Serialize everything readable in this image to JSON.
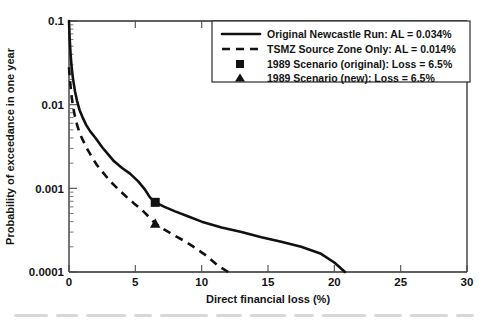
{
  "chart_data": {
    "type": "line",
    "title": "",
    "xlabel": "Direct financial loss (%)",
    "ylabel": "Probability of exceedance in one year",
    "xlim": [
      0,
      30
    ],
    "ylim": [
      0.0001,
      0.1
    ],
    "yscale": "log",
    "xscale": "linear",
    "grid": false,
    "legend_position": "upper right",
    "xticks": [
      0,
      5,
      10,
      15,
      20,
      25,
      30
    ],
    "xtick_labels": [
      "0",
      "5",
      "10",
      "15",
      "20",
      "25",
      "30"
    ],
    "yticks": [
      0.1,
      0.01,
      0.001,
      0.0001
    ],
    "ytick_labels": [
      "0.1",
      "0.01",
      "0.001",
      "0.0001"
    ],
    "series": [
      {
        "name": "Original Newcastle Run: AL = 0.034%",
        "style": "solid",
        "color": "#111111",
        "x": [
          0.0,
          0.05,
          0.12,
          0.2,
          0.3,
          0.45,
          0.6,
          0.8,
          1.0,
          1.3,
          1.6,
          2.0,
          2.5,
          3.0,
          3.4,
          4.0,
          4.6,
          5.2,
          5.7,
          6.1,
          6.5,
          7.2,
          8.0,
          9.0,
          10.0,
          11.5,
          13.0,
          14.5,
          16.0,
          17.5,
          19.0,
          20.0,
          20.8
        ],
        "y": [
          0.1,
          0.062,
          0.04,
          0.028,
          0.0205,
          0.0145,
          0.0112,
          0.0086,
          0.0072,
          0.0057,
          0.0048,
          0.004,
          0.0031,
          0.0025,
          0.0021,
          0.00175,
          0.0015,
          0.00122,
          0.00098,
          0.00078,
          0.00068,
          0.0006,
          0.00053,
          0.00046,
          0.0004,
          0.00034,
          0.0003,
          0.00026,
          0.00023,
          0.0002,
          0.000165,
          0.00013,
          0.0001
        ]
      },
      {
        "name": "TSMZ Source Zone Only: AL = 0.014%",
        "style": "dashed",
        "color": "#111111",
        "x": [
          0.0,
          0.05,
          0.12,
          0.2,
          0.3,
          0.45,
          0.6,
          0.8,
          1.0,
          1.3,
          1.7,
          2.1,
          2.6,
          3.1,
          3.7,
          4.3,
          4.9,
          5.5,
          6.0,
          6.5,
          7.2,
          8.0,
          8.8,
          9.6,
          10.4,
          11.2,
          12.0
        ],
        "y": [
          0.028,
          0.022,
          0.0165,
          0.0125,
          0.0095,
          0.0072,
          0.0058,
          0.0046,
          0.0039,
          0.0031,
          0.0024,
          0.0019,
          0.00152,
          0.00122,
          0.00098,
          0.0008,
          0.00066,
          0.00055,
          0.00046,
          0.00038,
          0.00032,
          0.00027,
          0.00023,
          0.00019,
          0.000155,
          0.00012,
          0.0001
        ]
      }
    ],
    "points": [
      {
        "name": "1989 Scenario (original): Loss = 6.5%",
        "marker": "square",
        "color": "#111111",
        "x": 6.5,
        "y": 0.00068
      },
      {
        "name": "1989 Scenario (new): Loss = 6.5%",
        "marker": "triangle",
        "color": "#111111",
        "x": 6.5,
        "y": 0.00038
      }
    ],
    "legend_entries": [
      {
        "label": "Original Newcastle Run: AL = 0.034%",
        "marker": "solid-line"
      },
      {
        "label": "TSMZ Source Zone Only: AL = 0.014%",
        "marker": "dashed-line"
      },
      {
        "label": "1989 Scenario (original): Loss = 6.5%",
        "marker": "square"
      },
      {
        "label": "1989 Scenario (new): Loss = 6.5%",
        "marker": "triangle"
      }
    ]
  }
}
